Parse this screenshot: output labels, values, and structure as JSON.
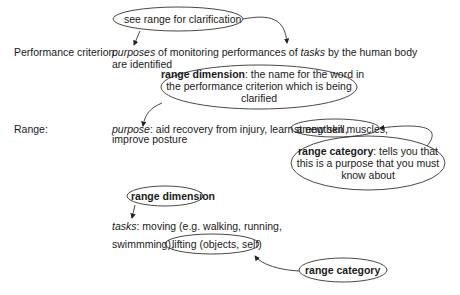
{
  "criterion": {
    "label": "Performance criterion:",
    "line1_italic_a": "purposes",
    "line1_mid": " of monitoring performances of ",
    "line1_italic_b": "tasks",
    "line1_end": " by the human body",
    "line2": "are identified"
  },
  "range": {
    "label": "Range:",
    "purpose_italic": "purpose",
    "purpose_text": ": aid recovery from injury, learn a new skill,",
    "purpose_circled": "strengthen muscles,",
    "purpose_line2": "improve posture",
    "tasks_italic": "tasks",
    "tasks_text": ": moving (e.g. walking, running,",
    "tasks_line2": "swimmming),",
    "tasks_circled": "lifting (objects, self)"
  },
  "callouts": {
    "see_range": "see range for clarification",
    "range_dimension_big": {
      "bold": "range dimension",
      "line1": ": the name for the word in",
      "line2": "the performance criterion which is being",
      "line3": "clarified"
    },
    "range_category_big": {
      "bold": "range category",
      "line1": ": tells you that",
      "line2": "this is a purpose that you must",
      "line3": "know about"
    },
    "range_dimension_small": "range dimension",
    "range_category_small": "range category"
  },
  "colors": {
    "text": "#1a1a1a",
    "stroke": "#333333",
    "background": "#ffffff"
  }
}
